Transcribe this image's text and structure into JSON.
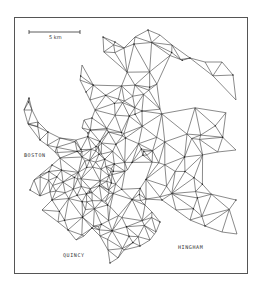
{
  "figure": {
    "type": "finite-element triangular mesh map",
    "scale_bar": {
      "label": "5 km"
    },
    "place_labels": [
      {
        "name": "BOSTON",
        "x": 24,
        "y": 152
      },
      {
        "name": "QUINCY",
        "x": 63,
        "y": 252
      },
      {
        "name": "HINGHAM",
        "x": 178,
        "y": 244
      }
    ],
    "colors": {
      "line": "#2a2a2a",
      "frame": "#555555",
      "background": "#ffffff"
    }
  }
}
